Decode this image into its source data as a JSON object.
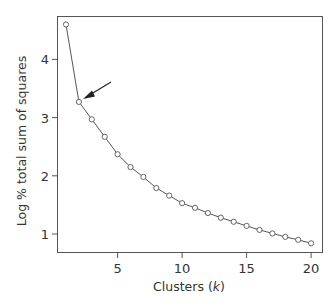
{
  "chart_data": {
    "type": "line",
    "title": "",
    "xlabel": "Clusters (k)",
    "xlabel_parts": {
      "prefix": "Clusters (",
      "italic": "k",
      "suffix": ")"
    },
    "ylabel": "Log % total sum of squares",
    "x": [
      1,
      2,
      3,
      4,
      5,
      6,
      7,
      8,
      9,
      10,
      11,
      12,
      13,
      14,
      15,
      16,
      17,
      18,
      19,
      20
    ],
    "series": [
      {
        "name": "Log % total sum of squares",
        "values": [
          4.6,
          3.27,
          2.97,
          2.67,
          2.37,
          2.15,
          1.98,
          1.79,
          1.66,
          1.53,
          1.45,
          1.36,
          1.28,
          1.21,
          1.14,
          1.07,
          1.01,
          0.95,
          0.9,
          0.84
        ]
      }
    ],
    "xlim": [
      0.3,
      20.8
    ],
    "ylim": [
      0.68,
      4.73
    ],
    "xticks": [
      5,
      10,
      15,
      20
    ],
    "yticks": [
      1,
      2,
      3,
      4
    ],
    "grid": false,
    "legend": null,
    "marker": "open-circle",
    "line_color": "#555555",
    "annotations": [
      {
        "type": "arrow",
        "points_to_k": 2,
        "description": "elbow point"
      }
    ]
  }
}
